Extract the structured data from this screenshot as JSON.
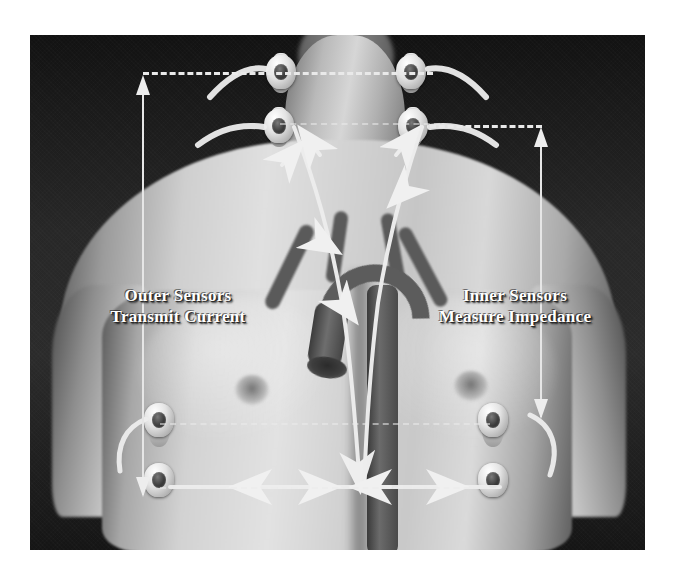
{
  "figure": {
    "kind": "medical-illustration",
    "labels": {
      "left": {
        "line1": "Outer Sensors",
        "line2": "Transmit Current"
      },
      "right": {
        "line1": "Inner Sensors",
        "line2": "Measure Impedance"
      }
    },
    "colors": {
      "background": "#1b1b1b",
      "annotation": "#e9e9e9",
      "label_text": "#ffffff",
      "page": "#ffffff"
    },
    "sensors": [
      {
        "id": "outer-upper-left",
        "group": "outer",
        "region": "neck"
      },
      {
        "id": "outer-upper-right",
        "group": "outer",
        "region": "neck"
      },
      {
        "id": "inner-upper-left",
        "group": "inner",
        "region": "neck-base"
      },
      {
        "id": "inner-upper-right",
        "group": "inner",
        "region": "neck-base"
      },
      {
        "id": "inner-lower-left",
        "group": "inner",
        "region": "lower-thorax"
      },
      {
        "id": "inner-lower-right",
        "group": "inner",
        "region": "lower-thorax"
      },
      {
        "id": "outer-lower-left",
        "group": "outer",
        "region": "lower-thorax"
      },
      {
        "id": "outer-lower-right",
        "group": "outer",
        "region": "lower-thorax"
      }
    ],
    "annotations": {
      "outer_span": {
        "role": "current-transmit-span",
        "style": "dashed-bracket-with-arrow"
      },
      "inner_span": {
        "role": "impedance-measure-span",
        "style": "dashed-bracket-with-arrow"
      },
      "current_path": {
        "role": "current-flow",
        "style": "solid-line-with-arrowheads"
      }
    }
  }
}
